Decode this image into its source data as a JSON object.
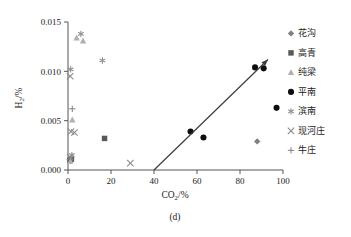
{
  "chart_data": {
    "type": "scatter",
    "title": "",
    "caption": "(d)",
    "xlabel": "CO2/%",
    "ylabel": "H2/%",
    "xlabel_base": "CO",
    "xlabel_sub": "2",
    "xlabel_unit": "/%",
    "ylabel_base": "H",
    "ylabel_sub": "2",
    "ylabel_unit": "/%",
    "xlim": [
      0,
      100
    ],
    "ylim": [
      0.0,
      0.015
    ],
    "xticks": [
      0,
      20,
      40,
      60,
      80,
      100
    ],
    "xtick_labels": [
      "0",
      "20",
      "40",
      "60",
      "80",
      "100"
    ],
    "yticks": [
      0.0,
      0.005,
      0.01,
      0.015
    ],
    "ytick_labels": [
      "0.000",
      "0.005",
      "0.010",
      "0.015"
    ],
    "grid": false,
    "legend_position": "right",
    "annotation": {
      "name": "trend-arrow",
      "type": "arrow",
      "from": [
        40,
        0.0
      ],
      "to": [
        93,
        0.0112
      ]
    },
    "series": [
      {
        "name": "花沟",
        "marker": "diamond",
        "color": "#808080",
        "points": [
          [
            88,
            0.0029
          ],
          [
            0.8,
            0.0011
          ],
          [
            1.2,
            0.0009
          ]
        ]
      },
      {
        "name": "高青",
        "marker": "square",
        "color": "#595959",
        "points": [
          [
            17,
            0.0032
          ],
          [
            0.9,
            0.001
          ],
          [
            1.6,
            0.0011
          ]
        ]
      },
      {
        "name": "纯梁",
        "marker": "triangle",
        "color": "#b0b0b0",
        "points": [
          [
            4,
            0.0134
          ],
          [
            7,
            0.0131
          ],
          [
            2,
            0.0051
          ],
          [
            1.1,
            0.0009
          ]
        ]
      },
      {
        "name": "平南",
        "marker": "circle",
        "color": "#0d0d0d",
        "points": [
          [
            57,
            0.0039
          ],
          [
            63,
            0.0033
          ],
          [
            87,
            0.0104
          ],
          [
            91,
            0.0103
          ],
          [
            97,
            0.0063
          ]
        ]
      },
      {
        "name": "滨南",
        "marker": "asterisk",
        "color": "#909090",
        "points": [
          [
            6,
            0.0138
          ],
          [
            16,
            0.0111
          ],
          [
            1.2,
            0.0102
          ],
          [
            1.8,
            0.0015
          ]
        ]
      },
      {
        "name": "现河庄",
        "marker": "cross",
        "color": "#8a8a8a",
        "points": [
          [
            1.0,
            0.0095
          ],
          [
            1.4,
            0.0039
          ],
          [
            3.0,
            0.0038
          ],
          [
            29,
            0.0007
          ],
          [
            1.0,
            0.0013
          ]
        ]
      },
      {
        "name": "牛庄",
        "marker": "plus",
        "color": "#8a8a8a",
        "points": [
          [
            2,
            0.0062
          ]
        ]
      }
    ]
  },
  "legend": {
    "items": [
      {
        "label": "花沟",
        "marker": "diamond",
        "color": "#808080"
      },
      {
        "label": "高青",
        "marker": "square",
        "color": "#595959"
      },
      {
        "label": "纯梁",
        "marker": "triangle",
        "color": "#b0b0b0"
      },
      {
        "label": "平南",
        "marker": "circle",
        "color": "#0d0d0d"
      },
      {
        "label": "滨南",
        "marker": "asterisk",
        "color": "#909090"
      },
      {
        "label": "现河庄",
        "marker": "cross",
        "color": "#8a8a8a"
      },
      {
        "label": "牛庄",
        "marker": "plus",
        "color": "#8a8a8a"
      }
    ]
  }
}
